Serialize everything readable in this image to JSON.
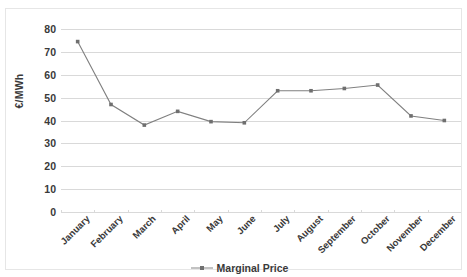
{
  "chart_data": {
    "type": "line",
    "title": "",
    "xlabel": "",
    "ylabel": "€/MWh",
    "categories": [
      "January",
      "February",
      "March",
      "April",
      "May",
      "June",
      "July",
      "August",
      "September",
      "October",
      "November",
      "December"
    ],
    "series": [
      {
        "name": "Marginal Price",
        "values": [
          74.5,
          47.0,
          38.0,
          44.0,
          39.5,
          39.0,
          53.0,
          53.0,
          54.0,
          55.5,
          42.0,
          40.0
        ],
        "color": "#808080",
        "marker": "square"
      }
    ],
    "ylim": [
      0,
      80
    ],
    "yticks": [
      0,
      10,
      20,
      30,
      40,
      50,
      60,
      70,
      80
    ],
    "ytick_labels": [
      "0",
      "10",
      "20",
      "30",
      "40",
      "50",
      "60",
      "70",
      "80"
    ],
    "grid": true,
    "grid_axis": "y",
    "grid_color": "#d9d9d9",
    "legend": {
      "position": "bottom",
      "entries": [
        "Marginal Price"
      ]
    },
    "background": "#ffffff",
    "border_color": "#e6e6e6",
    "text_color": "#3a3a3a"
  }
}
